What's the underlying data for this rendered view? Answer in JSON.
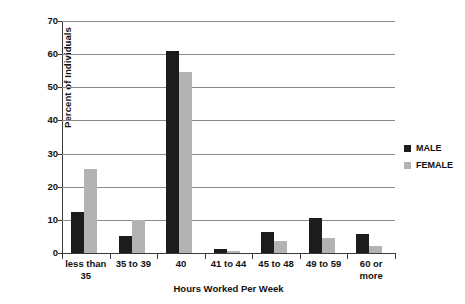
{
  "chart_data": {
    "type": "bar",
    "title": "",
    "subtitle": "",
    "xlabel": "Hours Worked Per Week",
    "ylabel": "Percent of Individuals",
    "ylim": [
      0,
      70
    ],
    "ytick_values": [
      0,
      10,
      20,
      30,
      40,
      50,
      60,
      70
    ],
    "ytick_labels": [
      "0",
      "10",
      "20",
      "30",
      "40",
      "50",
      "60",
      "70"
    ],
    "grid": true,
    "grid_axis": "y",
    "legend_position": "right",
    "categories": [
      "less than\n35",
      "35 to 39",
      "40",
      "41 to 44",
      "45 to 48",
      "49 to 59",
      "60 or\nmore"
    ],
    "series": [
      {
        "name": "MALE",
        "color": "#1c1c1c",
        "values": [
          12.3,
          5.0,
          61.0,
          1.3,
          6.3,
          10.5,
          5.8
        ]
      },
      {
        "name": "FEMALE",
        "color": "#b3b3b3",
        "values": [
          25.3,
          10.0,
          54.5,
          0.6,
          3.5,
          4.5,
          2.2
        ]
      }
    ],
    "annotations": []
  },
  "legend": {
    "items": [
      {
        "label": "MALE",
        "color": "#1c1c1c"
      },
      {
        "label": "FEMALE",
        "color": "#b3b3b3"
      }
    ]
  },
  "colors": {
    "background": "#ffffff",
    "axis": "#3a3a3a",
    "gridline": "#8a8a8a",
    "text": "#111111",
    "male": "#1c1c1c",
    "female": "#b3b3b3"
  }
}
